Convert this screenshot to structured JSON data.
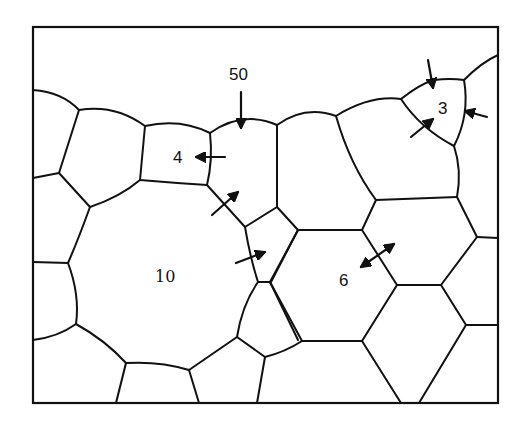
{
  "figure": {
    "title": "",
    "labels": {
      "top_grain": "50",
      "small_left_grain": "4",
      "small_right_grain": "3",
      "large_grain": "10",
      "hex_grain": "6"
    },
    "colors": {
      "line": "#111111",
      "background": "#ffffff"
    }
  }
}
